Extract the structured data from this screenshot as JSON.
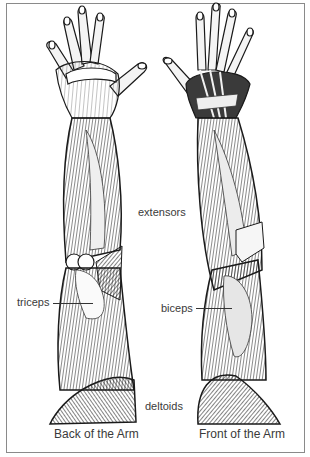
{
  "figure": {
    "type": "anatomical-illustration",
    "panels": [
      {
        "id": "back",
        "caption": "Back of the Arm"
      },
      {
        "id": "front",
        "caption": "Front of the Arm"
      }
    ],
    "labels": {
      "extensors": "extensors",
      "triceps": "triceps",
      "biceps": "biceps",
      "deltoids": "deltoids"
    },
    "colors": {
      "ink": "#1a1a1a",
      "shade": "#4a4a4a",
      "highlight": "#f2f2f2",
      "border": "#8a8a8a",
      "text": "#3a3a3a"
    }
  }
}
